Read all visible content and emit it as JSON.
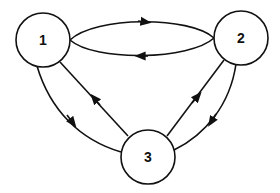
{
  "diagram": {
    "type": "directed-graph",
    "nodes": [
      {
        "id": "1",
        "label": "1",
        "cx": 43,
        "cy": 40,
        "r": 27
      },
      {
        "id": "2",
        "label": "2",
        "cx": 241,
        "cy": 38,
        "r": 27
      },
      {
        "id": "3",
        "label": "3",
        "cx": 148,
        "cy": 157,
        "r": 27
      }
    ],
    "edges": [
      {
        "from": "1",
        "to": "2",
        "style": "upper-arc"
      },
      {
        "from": "2",
        "to": "1",
        "style": "lower-arc"
      },
      {
        "from": "1",
        "to": "3",
        "style": "outer-curve"
      },
      {
        "from": "3",
        "to": "1",
        "style": "inner-line"
      },
      {
        "from": "3",
        "to": "2",
        "style": "inner-line"
      },
      {
        "from": "2",
        "to": "3",
        "style": "outer-curve"
      }
    ],
    "colors": {
      "stroke": "#111111",
      "fill": "#ffffff"
    }
  }
}
